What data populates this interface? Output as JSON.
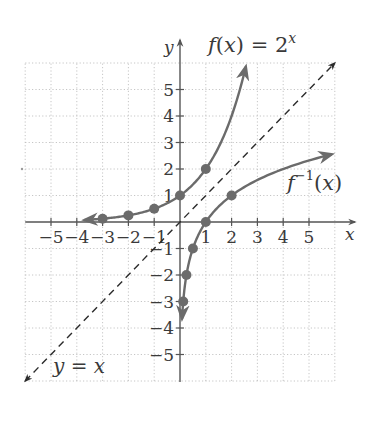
{
  "chart_data": {
    "type": "line",
    "title": "",
    "xlabel": "x",
    "ylabel": "y",
    "xlim": [
      -6,
      6
    ],
    "ylim": [
      -6,
      6
    ],
    "grid": true,
    "x_ticks": [
      -5,
      -4,
      -3,
      -2,
      -1,
      1,
      2,
      3,
      4,
      5
    ],
    "y_ticks": [
      -5,
      -4,
      -3,
      -2,
      -1,
      1,
      2,
      3,
      4,
      5
    ],
    "x_tick_labels": [
      "−5",
      "−4",
      "−3",
      "−2",
      "−1",
      "1",
      "2",
      "3",
      "4",
      "5"
    ],
    "y_tick_labels": [
      "−5",
      "−4",
      "−3",
      "−2",
      "−1",
      "1",
      "2",
      "3",
      "4",
      "5"
    ],
    "series": [
      {
        "name": "f(x) = 2^x",
        "style": "solid",
        "color": "#6b6b6b",
        "points": [
          [
            -3,
            0.125
          ],
          [
            -2,
            0.25
          ],
          [
            -1,
            0.5
          ],
          [
            0,
            1
          ],
          [
            1,
            2
          ]
        ],
        "curve_range": [
          -3.7,
          2.55
        ]
      },
      {
        "name": "f^-1(x)",
        "style": "solid",
        "color": "#6b6b6b",
        "points": [
          [
            0.125,
            -3
          ],
          [
            0.25,
            -2
          ],
          [
            0.5,
            -1
          ],
          [
            1,
            0
          ],
          [
            2,
            1
          ]
        ],
        "curve_range": [
          0.08,
          5.9
        ]
      },
      {
        "name": "y = x",
        "style": "dashed",
        "color": "#2b2b2b",
        "points": [
          [
            -6,
            -6
          ],
          [
            6,
            6
          ]
        ]
      }
    ],
    "annotations": [
      {
        "text": "f(x) = 2",
        "sup": "x",
        "near": [
          1.1,
          6.6
        ]
      },
      {
        "text": "f",
        "sup": "−1",
        "suffix": "(x)",
        "near": [
          4.2,
          1.3
        ]
      },
      {
        "text": "y = x",
        "near": [
          -4.8,
          -5.7
        ]
      }
    ]
  },
  "labels": {
    "x_axis": "x",
    "y_axis": "y",
    "f_label_main": "f(x) = 2",
    "f_label_sup": "x",
    "finv_label_f": "f",
    "finv_label_sup": "−1",
    "finv_label_rest": "(x)",
    "identity_label": "y = x"
  },
  "colors": {
    "grid": "#b8b8b8",
    "axis": "#555555",
    "curve": "#6b6b6b",
    "dashed": "#2b2b2b",
    "text": "#3a3a3a"
  }
}
